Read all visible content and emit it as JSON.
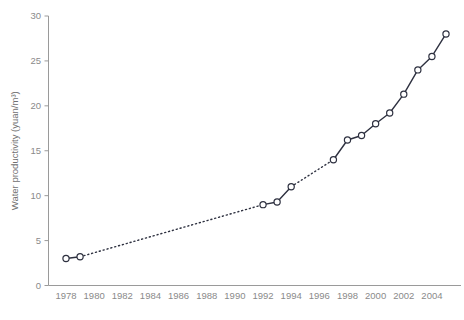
{
  "chart_data": {
    "type": "line",
    "title": "",
    "subtitle": "",
    "xlabel": "",
    "ylabel": "Water productivity (yuan/m³)",
    "xlim": [
      1978,
      2005
    ],
    "ylim": [
      0,
      30
    ],
    "grid": false,
    "legend": "none",
    "x_tick_labels": [
      "1978",
      "1980",
      "1982",
      "1984",
      "1986",
      "1988",
      "1990",
      "1992",
      "1994",
      "1996",
      "1998",
      "2000",
      "2002",
      "2004"
    ],
    "x_tick_values": [
      1978,
      1980,
      1982,
      1984,
      1986,
      1988,
      1990,
      1992,
      1994,
      1996,
      1998,
      2000,
      2002,
      2004
    ],
    "y_tick_labels": [
      "0",
      "5",
      "10",
      "15",
      "20",
      "25",
      "30"
    ],
    "y_tick_values": [
      0,
      5,
      10,
      15,
      20,
      25,
      30
    ],
    "marker": "open-circle",
    "series": [
      {
        "name": "Water productivity",
        "x": [
          1978,
          1979,
          1992,
          1993,
          1994,
          1997,
          1998,
          1999,
          2000,
          2001,
          2002,
          2003,
          2004,
          2005
        ],
        "values": [
          3.0,
          3.2,
          9.0,
          9.3,
          11.0,
          14.0,
          16.2,
          16.7,
          18.0,
          19.2,
          21.3,
          24.0,
          25.5,
          28.0
        ]
      }
    ],
    "segments": [
      {
        "from_index": 0,
        "to_index": 1,
        "style": "solid"
      },
      {
        "from_index": 1,
        "to_index": 2,
        "style": "dotted"
      },
      {
        "from_index": 2,
        "to_index": 3,
        "style": "solid"
      },
      {
        "from_index": 3,
        "to_index": 4,
        "style": "solid"
      },
      {
        "from_index": 4,
        "to_index": 5,
        "style": "dotted"
      },
      {
        "from_index": 5,
        "to_index": 6,
        "style": "solid"
      },
      {
        "from_index": 6,
        "to_index": 7,
        "style": "solid"
      },
      {
        "from_index": 7,
        "to_index": 8,
        "style": "solid"
      },
      {
        "from_index": 8,
        "to_index": 9,
        "style": "solid"
      },
      {
        "from_index": 9,
        "to_index": 10,
        "style": "solid"
      },
      {
        "from_index": 10,
        "to_index": 11,
        "style": "solid"
      },
      {
        "from_index": 11,
        "to_index": 12,
        "style": "solid"
      },
      {
        "from_index": 12,
        "to_index": 13,
        "style": "solid"
      }
    ],
    "colors": {
      "line": "#2e3140",
      "marker_fill": "#ffffff",
      "axis": "#9a9a9a",
      "tick_text": "#8a8a8a",
      "axis_title": "#6f6f6f",
      "background": "#ffffff"
    }
  }
}
